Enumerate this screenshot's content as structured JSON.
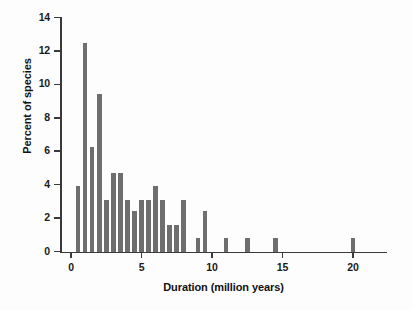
{
  "chart_data": {
    "type": "bar",
    "title": "",
    "xlabel": "Duration (million years)",
    "ylabel": "Percent of species",
    "xlim": [
      -0.5,
      23
    ],
    "ylim": [
      0,
      14
    ],
    "grid": false,
    "legend": null,
    "bar_color": "#6e6e6e",
    "axis_color": "#3a3a3a",
    "background_color": "#fdfdfd",
    "bar_width_units": 0.33,
    "x_ticks": [
      0,
      5,
      10,
      15,
      20
    ],
    "x_tick_labels": [
      "0",
      "5",
      "10",
      "15",
      "20"
    ],
    "y_ticks": [
      0,
      2,
      4,
      6,
      8,
      10,
      12,
      14
    ],
    "y_tick_labels": [
      "0",
      "2",
      "4",
      "6",
      "8",
      "10",
      "12",
      "14"
    ],
    "x": [
      0.5,
      1.0,
      1.5,
      2.0,
      2.5,
      3.0,
      3.5,
      4.0,
      4.5,
      5.0,
      5.5,
      6.0,
      6.5,
      7.0,
      7.5,
      8.0,
      9.0,
      9.5,
      11.0,
      12.5,
      14.5,
      20.0
    ],
    "values": [
      3.9,
      12.5,
      6.25,
      9.4,
      3.1,
      4.7,
      4.7,
      3.1,
      2.4,
      3.1,
      3.1,
      3.9,
      3.1,
      1.6,
      1.6,
      3.1,
      0.8,
      2.4,
      0.8,
      0.8,
      0.8,
      0.8
    ],
    "points": [
      {
        "x": 0.5,
        "y": 3.9
      },
      {
        "x": 1.0,
        "y": 12.5
      },
      {
        "x": 1.5,
        "y": 6.25
      },
      {
        "x": 2.0,
        "y": 9.4
      },
      {
        "x": 2.5,
        "y": 3.1
      },
      {
        "x": 3.0,
        "y": 4.7
      },
      {
        "x": 3.5,
        "y": 4.7
      },
      {
        "x": 4.0,
        "y": 3.1
      },
      {
        "x": 4.5,
        "y": 2.4
      },
      {
        "x": 5.0,
        "y": 3.1
      },
      {
        "x": 5.5,
        "y": 3.1
      },
      {
        "x": 6.0,
        "y": 3.9
      },
      {
        "x": 6.5,
        "y": 3.1
      },
      {
        "x": 7.0,
        "y": 1.6
      },
      {
        "x": 7.5,
        "y": 1.6
      },
      {
        "x": 8.0,
        "y": 3.1
      },
      {
        "x": 9.0,
        "y": 0.8
      },
      {
        "x": 9.5,
        "y": 2.4
      },
      {
        "x": 11.0,
        "y": 0.8
      },
      {
        "x": 12.5,
        "y": 0.8
      },
      {
        "x": 14.5,
        "y": 0.8
      },
      {
        "x": 20.0,
        "y": 0.8
      }
    ]
  }
}
